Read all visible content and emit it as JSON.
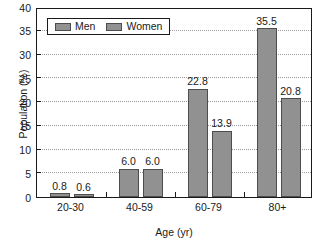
{
  "chart_data": {
    "type": "bar",
    "title": "",
    "subtitle": "",
    "xlabel": "Age (yr)",
    "ylabel": "Population (%)",
    "categories": [
      "20-30",
      "40-59",
      "60-79",
      "80+"
    ],
    "series": [
      {
        "name": "Men",
        "values": [
          0.8,
          6.0,
          22.8,
          35.5
        ],
        "color": "#919191"
      },
      {
        "name": "Women",
        "values": [
          0.6,
          6.0,
          13.9,
          20.8
        ],
        "color": "#919191"
      }
    ],
    "value_labels": {
      "Men": [
        "0.8",
        "6.0",
        "22.8",
        "35.5"
      ],
      "Women": [
        "0.6",
        "6.0",
        "13.9",
        "20.8"
      ]
    },
    "ylim": [
      0,
      40
    ],
    "yticks": [
      0,
      5,
      10,
      15,
      20,
      25,
      30,
      35,
      40
    ],
    "ytick_labels": [
      "0",
      "5",
      "10",
      "15",
      "20",
      "25",
      "30",
      "35",
      "40"
    ],
    "grid": true,
    "grid_axis": "y",
    "grid_style": "dotted",
    "legend": {
      "position": "top-left-inside",
      "entries": [
        "Men",
        "Women"
      ]
    },
    "colors": {
      "bar_fill": "#919191",
      "bar_edge": "#4d4d4d",
      "axis": "#1a1a1a",
      "grid": "#9a9a9a",
      "background": "#ffffff"
    }
  }
}
